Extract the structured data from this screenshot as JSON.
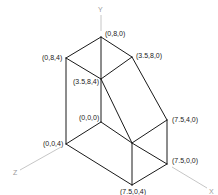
{
  "diagram": {
    "title": "",
    "type": "isometric-3d-solid",
    "axes": [
      {
        "name": "Y",
        "label": "Y"
      },
      {
        "name": "Z",
        "label": "Z"
      },
      {
        "name": "X",
        "label": "X"
      }
    ],
    "vertices": [
      {
        "id": "v080",
        "label": "(0,8,0)"
      },
      {
        "id": "v3580",
        "label": "(3.5,8,0)"
      },
      {
        "id": "v084",
        "label": "(0,8,4)"
      },
      {
        "id": "v3584",
        "label": "(3.5,8,4)"
      },
      {
        "id": "v000",
        "label": "(0,0,0)"
      },
      {
        "id": "v7540",
        "label": "(7.5,4,0)"
      },
      {
        "id": "v004",
        "label": "(0,0,4)"
      },
      {
        "id": "v7500",
        "label": "(7.5,0,0)"
      },
      {
        "id": "v7504",
        "label": "(7.5,0,4)"
      }
    ],
    "colors": {
      "edge": "#1a1a1a",
      "axis": "#b8b8b8",
      "label": "#222222",
      "axis_label": "#9a9a9a"
    }
  }
}
